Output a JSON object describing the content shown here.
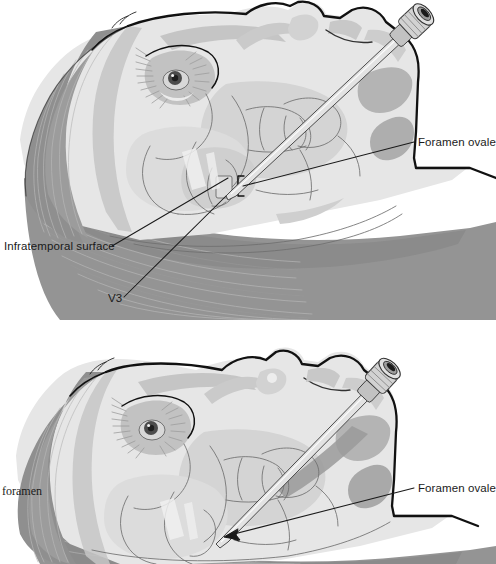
{
  "figure": {
    "panel_count": 2,
    "background_color": "#ffffff",
    "ink_color": "#1a1a1a"
  },
  "palette": {
    "outline": "#111111",
    "skin_light": "#e8e8e8",
    "skin_mid": "#dcdcdc",
    "bone_light": "#dedede",
    "bone_mid": "#cfcfcf",
    "muscle_mid": "#9e9e9e",
    "muscle_dark": "#8a8a8a",
    "shadow_dark": "#8f8f8f",
    "accent_gray": "#b5b5b5",
    "needle_fill": "#e3e3e3",
    "needle_stroke": "#3a3a3a",
    "leader_line": "#1a1a1a",
    "background": "#ffffff"
  },
  "panels": [
    {
      "id": "upper",
      "name": "upper-panel",
      "region": {
        "x": 0,
        "y": 0,
        "width": 496,
        "height": 320
      },
      "description": "Lateral head with temporalis and masseter muscles exposed; needle advanced toward foramen ovale; three labeled leader lines.",
      "labels": [
        {
          "id": "foramen-ovale-upper",
          "text": "Foramen ovale",
          "font_style": "sans-serif",
          "text_x": 418,
          "text_y": 146,
          "anchor": "start",
          "leader_from": [
            414,
            142
          ],
          "leader_to": [
            243,
            186
          ],
          "arrowhead": false
        },
        {
          "id": "infratemporal-surface",
          "text": "Infratemporal surface",
          "font_style": "sans-serif",
          "text_x": 4,
          "text_y": 250,
          "anchor": "start",
          "leader_from": [
            112,
            246
          ],
          "leader_to": [
            228,
            178
          ],
          "arrowhead": false
        },
        {
          "id": "v3",
          "text": "V3",
          "font_style": "sans-serif",
          "text_x": 108,
          "text_y": 302,
          "anchor": "start",
          "leader_from": [
            124,
            297
          ],
          "leader_to": [
            226,
            196
          ],
          "arrowhead": false
        }
      ],
      "needle": {
        "name": "cannula-needle",
        "hub_center": [
          411,
          26
        ],
        "hub_type": "luer-lock-hub",
        "tip": [
          228,
          196
        ],
        "angle_deg": 34
      }
    },
    {
      "id": "lower",
      "name": "lower-panel",
      "region": {
        "x": 0,
        "y": 320,
        "width": 496,
        "height": 244
      },
      "description": "Same lateral head with soft tissue intact; needle advanced more deeply; arrow indicates the foramen ovale entry point.",
      "labels": [
        {
          "id": "foramen-ovale-lower",
          "text": "Foramen ovale",
          "font_style": "sans-serif",
          "text_x": 418,
          "text_y": 492,
          "anchor": "start",
          "leader_from": [
            414,
            488
          ],
          "leader_to": [
            228,
            535
          ],
          "arrowhead": true
        },
        {
          "id": "foramen-cropped",
          "text": "foramen",
          "font_style": "serif",
          "text_x": 2,
          "text_y": 495,
          "anchor": "start",
          "cropped_at_left_edge": true,
          "leader_from": null,
          "leader_to": null,
          "arrowhead": false
        }
      ],
      "needle": {
        "name": "cannula-needle",
        "hub_center": [
          378,
          61
        ],
        "hub_type": "luer-lock-hub",
        "tip": [
          218,
          222
        ],
        "angle_deg": 41
      }
    }
  ]
}
